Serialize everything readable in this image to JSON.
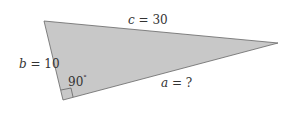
{
  "diagram": {
    "type": "right-triangle",
    "fill_color": "#c8c8c8",
    "stroke_color": "#666666",
    "vertices": {
      "top_left": [
        44,
        21
      ],
      "right": [
        278,
        43
      ],
      "right_angle": [
        63,
        100
      ]
    },
    "labels": {
      "c": {
        "var": "c",
        "value": " = 30"
      },
      "b": {
        "var": "b",
        "value": " = 10"
      },
      "a": {
        "var": "a",
        "value": " = ?"
      },
      "angle": {
        "value": "90",
        "unit": "°"
      }
    }
  }
}
